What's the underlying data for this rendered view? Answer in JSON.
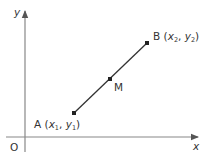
{
  "diagram": {
    "title": "",
    "axes": {
      "x_label": "x",
      "y_label": "y",
      "origin_label": "O",
      "axis_color": "#777777"
    },
    "segment": {
      "color": "#333333",
      "points": [
        {
          "id": "A",
          "name": "A",
          "coord_x": "x",
          "coord_x_sub": "1",
          "coord_y": "y",
          "coord_y_sub": "1",
          "px": 74,
          "py": 113
        },
        {
          "id": "M",
          "name": "M",
          "px": 110,
          "py": 79
        },
        {
          "id": "B",
          "name": "B",
          "coord_x": "x",
          "coord_x_sub": "2",
          "coord_y": "y",
          "coord_y_sub": "2",
          "px": 147,
          "py": 43
        }
      ]
    },
    "labels": {
      "A": {
        "name": "A",
        "open": " (",
        "x": "x",
        "x_sub": "1",
        "sep": ", ",
        "y": "y",
        "y_sub": "1",
        "close": ")"
      },
      "B": {
        "name": "B",
        "open": " (",
        "x": "x",
        "x_sub": "2",
        "sep": ", ",
        "y": "y",
        "y_sub": "2",
        "close": ")"
      },
      "M": {
        "name": "M"
      }
    }
  }
}
